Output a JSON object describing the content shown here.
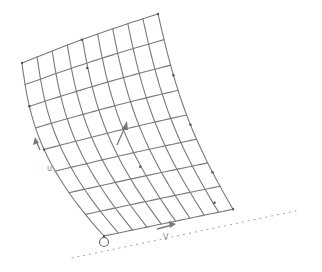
{
  "figure": {
    "mesh": {
      "rows": 8,
      "columns": 9
    },
    "labels": {
      "axis_v": "V",
      "axis_left_upper": "N",
      "axis_left_lower": "u"
    },
    "colors": {
      "mesh": "#7a7a7a",
      "node": "#555555",
      "background": "#ffffff"
    }
  }
}
